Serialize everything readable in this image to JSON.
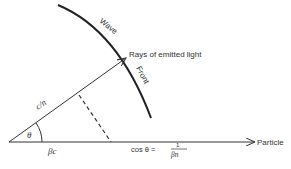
{
  "diagram": {
    "labels": {
      "wave": "Wave",
      "front": "Front",
      "rays": "Rays of emitted light",
      "ray_length": "c/n",
      "angle": "θ",
      "particle_distance": "βc",
      "particle": "Particle",
      "formula_lhs": "cos θ =",
      "formula_num": "1",
      "formula_den": "βn"
    },
    "colors": {
      "ink": "#333333",
      "background": "#ffffff"
    }
  }
}
